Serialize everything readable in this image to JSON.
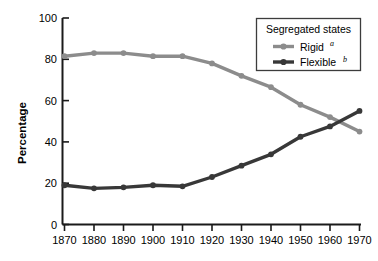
{
  "chart_data": {
    "type": "line",
    "title": "",
    "xlabel": "",
    "ylabel": "Percentage",
    "x": [
      1870,
      1880,
      1890,
      1900,
      1910,
      1920,
      1930,
      1940,
      1950,
      1960,
      1970
    ],
    "xticklabels": [
      "1870",
      "1880",
      "1890",
      "1900",
      "1910",
      "1920",
      "1930",
      "1940",
      "1950",
      "1960",
      "1970"
    ],
    "yticklabels": [
      "0",
      "20",
      "40",
      "60",
      "80",
      "100"
    ],
    "yticks": [
      0,
      20,
      40,
      60,
      80,
      100
    ],
    "xlim": [
      1870,
      1970
    ],
    "ylim": [
      0,
      100
    ],
    "grid": false,
    "legend_position": "top-right",
    "legend_title": "Segregated states",
    "series": [
      {
        "name": "Rigid",
        "name_sup": "a",
        "color": "#8c8c8c",
        "values": [
          81.5,
          83,
          83,
          81.5,
          81.5,
          78,
          72,
          66.5,
          58,
          52,
          45
        ]
      },
      {
        "name": "Flexible",
        "name_sup": "b",
        "color": "#383838",
        "values": [
          19,
          17.5,
          18,
          19,
          18.5,
          23,
          28.5,
          34,
          42.5,
          47.5,
          55
        ]
      }
    ]
  },
  "axes": {
    "y_title": "Percentage"
  },
  "legend": {
    "title": "Segregated states",
    "items": [
      {
        "label": "Rigid",
        "sup": "a",
        "color": "#8c8c8c"
      },
      {
        "label": "Flexible",
        "sup": "b",
        "color": "#383838"
      }
    ]
  },
  "colors": {
    "axis": "#1a1a1a",
    "rigid": "#8c8c8c",
    "flexible": "#383838",
    "legend_border": "#3c3c3c",
    "background": "#ffffff"
  }
}
